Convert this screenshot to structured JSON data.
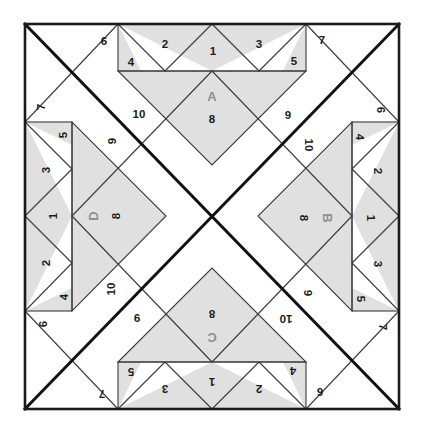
{
  "canvas": {
    "width": 422,
    "height": 442,
    "background": "#ffffff"
  },
  "block": {
    "title": "Quilt Block Foundation Piecing Diagram",
    "x": 25,
    "y": 24,
    "width": 374,
    "height": 385,
    "symmetry": "4-fold rotational",
    "colors": {
      "background": "#ffffff",
      "fabric_light": "#ffffff",
      "fabric_shade": "#e0e0e0",
      "outline": "#1b1b1b",
      "outline_thin": "#3a3a3a",
      "bold_diagonal": "#111111",
      "section_label": "#8f8f8f",
      "number_label": "#1b1b1b"
    },
    "line_weights": {
      "border": 2.6,
      "bold_diagonal": 3.0,
      "piece": 1.1
    }
  },
  "sections": [
    {
      "id": "A",
      "label": "A",
      "position": "top",
      "rotation": 0,
      "center_x": 212,
      "center_y": 97,
      "piece_label": "8"
    },
    {
      "id": "B",
      "label": "B",
      "position": "right",
      "rotation": 90,
      "center_x": 326,
      "center_y": 219,
      "piece_label": "8"
    },
    {
      "id": "C",
      "label": "C",
      "position": "bottom",
      "rotation": 180,
      "center_x": 212,
      "center_y": 338,
      "piece_label": "8"
    },
    {
      "id": "D",
      "label": "D",
      "position": "left",
      "rotation": 270,
      "center_x": 92,
      "center_y": 217,
      "piece_label": "8"
    }
  ],
  "piece_numbers": {
    "geese_strip": [
      "1",
      "2",
      "3",
      "4",
      "5"
    ],
    "corners": [
      "6",
      "7"
    ],
    "center_triangle": "8",
    "diagonal_strips": [
      "9",
      "10"
    ]
  },
  "labels_top": [
    {
      "text": "6",
      "x": 104,
      "y": 41,
      "rot": 0,
      "kind": "number"
    },
    {
      "text": "4",
      "x": 131,
      "y": 62,
      "rot": 0,
      "kind": "number"
    },
    {
      "text": "2",
      "x": 165,
      "y": 44,
      "rot": 0,
      "kind": "number"
    },
    {
      "text": "1",
      "x": 213,
      "y": 51,
      "rot": 0,
      "kind": "number"
    },
    {
      "text": "3",
      "x": 259,
      "y": 44,
      "rot": 0,
      "kind": "number"
    },
    {
      "text": "5",
      "x": 294,
      "y": 61,
      "rot": 0,
      "kind": "number"
    },
    {
      "text": "7",
      "x": 322,
      "y": 40,
      "rot": 0,
      "kind": "number"
    },
    {
      "text": "A",
      "x": 212,
      "y": 96,
      "rot": 0,
      "kind": "section"
    },
    {
      "text": "8",
      "x": 212,
      "y": 119,
      "rot": 0,
      "kind": "number"
    },
    {
      "text": "10",
      "x": 139,
      "y": 114,
      "rot": 0,
      "kind": "number"
    },
    {
      "text": "9",
      "x": 288,
      "y": 115,
      "rot": 0,
      "kind": "number"
    }
  ],
  "labels_right": [
    {
      "text": "6",
      "x": 381,
      "y": 110,
      "rot": 90,
      "kind": "number"
    },
    {
      "text": "4",
      "x": 360,
      "y": 137,
      "rot": 90,
      "kind": "number"
    },
    {
      "text": "2",
      "x": 378,
      "y": 171,
      "rot": 90,
      "kind": "number"
    },
    {
      "text": "1",
      "x": 371,
      "y": 218,
      "rot": 90,
      "kind": "number"
    },
    {
      "text": "3",
      "x": 378,
      "y": 264,
      "rot": 90,
      "kind": "number"
    },
    {
      "text": "5",
      "x": 361,
      "y": 299,
      "rot": 90,
      "kind": "number"
    },
    {
      "text": "7",
      "x": 383,
      "y": 327,
      "rot": 90,
      "kind": "number"
    },
    {
      "text": "B",
      "x": 327,
      "y": 218,
      "rot": 90,
      "kind": "section"
    },
    {
      "text": "8",
      "x": 304,
      "y": 218,
      "rot": 90,
      "kind": "number"
    },
    {
      "text": "10",
      "x": 309,
      "y": 145,
      "rot": 90,
      "kind": "number"
    },
    {
      "text": "9",
      "x": 308,
      "y": 293,
      "rot": 90,
      "kind": "number"
    }
  ],
  "labels_bottom": [
    {
      "text": "6",
      "x": 320,
      "y": 392,
      "rot": 180,
      "kind": "number"
    },
    {
      "text": "4",
      "x": 293,
      "y": 371,
      "rot": 180,
      "kind": "number"
    },
    {
      "text": "2",
      "x": 259,
      "y": 389,
      "rot": 180,
      "kind": "number"
    },
    {
      "text": "1",
      "x": 212,
      "y": 382,
      "rot": 180,
      "kind": "number"
    },
    {
      "text": "3",
      "x": 165,
      "y": 389,
      "rot": 180,
      "kind": "number"
    },
    {
      "text": "5",
      "x": 131,
      "y": 372,
      "rot": 180,
      "kind": "number"
    },
    {
      "text": "7",
      "x": 102,
      "y": 394,
      "rot": 180,
      "kind": "number"
    },
    {
      "text": "C",
      "x": 212,
      "y": 337,
      "rot": 180,
      "kind": "section"
    },
    {
      "text": "8",
      "x": 212,
      "y": 314,
      "rot": 180,
      "kind": "number"
    },
    {
      "text": "10",
      "x": 286,
      "y": 319,
      "rot": 180,
      "kind": "number"
    },
    {
      "text": "9",
      "x": 137,
      "y": 318,
      "rot": 180,
      "kind": "number"
    }
  ],
  "labels_left": [
    {
      "text": "6",
      "x": 43,
      "y": 324,
      "rot": 270,
      "kind": "number"
    },
    {
      "text": "4",
      "x": 64,
      "y": 297,
      "rot": 270,
      "kind": "number"
    },
    {
      "text": "2",
      "x": 46,
      "y": 263,
      "rot": 270,
      "kind": "number"
    },
    {
      "text": "1",
      "x": 53,
      "y": 216,
      "rot": 270,
      "kind": "number"
    },
    {
      "text": "3",
      "x": 46,
      "y": 170,
      "rot": 270,
      "kind": "number"
    },
    {
      "text": "5",
      "x": 63,
      "y": 135,
      "rot": 270,
      "kind": "number"
    },
    {
      "text": "7",
      "x": 41,
      "y": 107,
      "rot": 270,
      "kind": "number"
    },
    {
      "text": "D",
      "x": 93,
      "y": 216,
      "rot": 270,
      "kind": "section"
    },
    {
      "text": "8",
      "x": 116,
      "y": 216,
      "rot": 270,
      "kind": "number"
    },
    {
      "text": "10",
      "x": 111,
      "y": 289,
      "rot": 270,
      "kind": "number"
    },
    {
      "text": "9",
      "x": 112,
      "y": 141,
      "rot": 270,
      "kind": "number"
    }
  ]
}
